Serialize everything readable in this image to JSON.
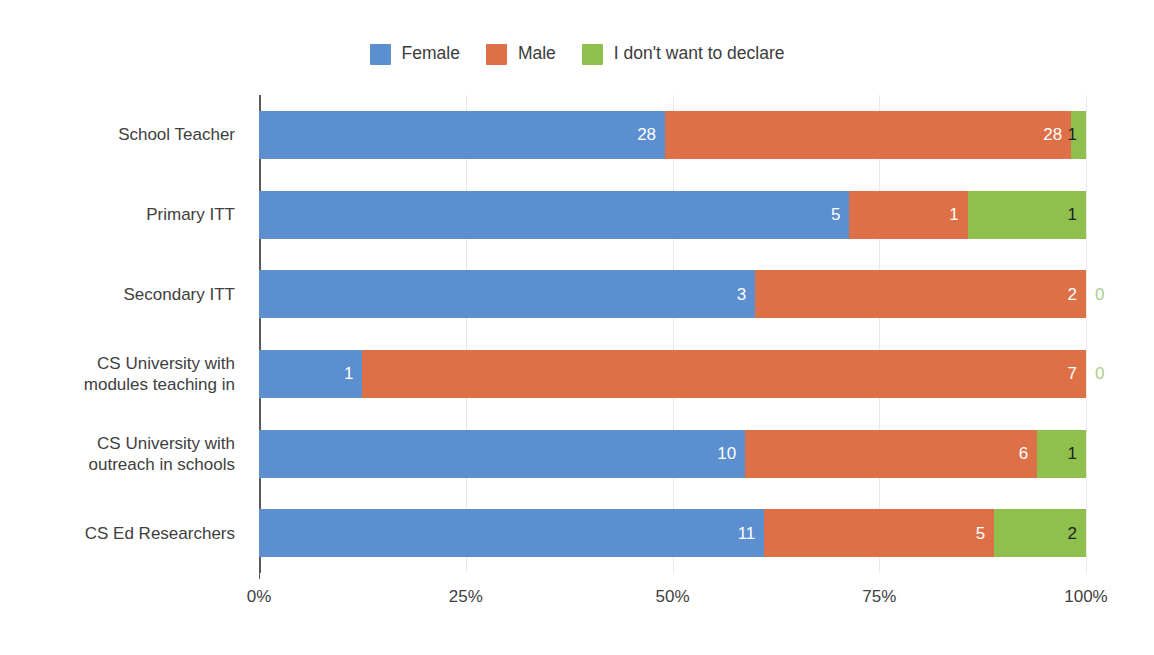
{
  "legend": {
    "position": "top-center",
    "entries": [
      {
        "label": "Female",
        "color": "#5b8fd0",
        "icon": "legend-swatch-female"
      },
      {
        "label": "Male",
        "color": "#dd7047",
        "icon": "legend-swatch-male"
      },
      {
        "label": "I don't want to declare",
        "color": "#8fbf4d",
        "icon": "legend-swatch-declare"
      }
    ]
  },
  "axis": {
    "x_ticks": [
      "0%",
      "25%",
      "50%",
      "75%",
      "100%"
    ],
    "x_tick_values": [
      0,
      25,
      50,
      75,
      100
    ]
  },
  "chart_data": {
    "type": "bar",
    "orientation": "horizontal",
    "stacked": true,
    "normalized": true,
    "title": "",
    "xlabel": "",
    "ylabel": "",
    "xlim": [
      0,
      100
    ],
    "grid": true,
    "legend_position": "top-center",
    "categories": [
      "School Teacher",
      "Primary ITT",
      "Secondary ITT",
      "CS University with modules teaching in",
      "CS University with outreach in schools",
      "CS Ed Researchers"
    ],
    "series": [
      {
        "name": "Female",
        "color": "#5b8fd0",
        "values": [
          28,
          5,
          3,
          1,
          10,
          11
        ]
      },
      {
        "name": "Male",
        "color": "#dd7047",
        "values": [
          28,
          1,
          2,
          7,
          6,
          5
        ]
      },
      {
        "name": "I don't want to declare",
        "color": "#8fbf4d",
        "values": [
          1,
          1,
          0,
          0,
          1,
          2
        ]
      }
    ],
    "row_totals": [
      57,
      7,
      5,
      8,
      17,
      18
    ],
    "percentages": [
      {
        "category": "School Teacher",
        "Female": 49.1,
        "Male": 49.1,
        "I don't want to declare": 1.8
      },
      {
        "category": "Primary ITT",
        "Female": 71.4,
        "Male": 14.3,
        "I don't want to declare": 14.3
      },
      {
        "category": "Secondary ITT",
        "Female": 60.0,
        "Male": 40.0,
        "I don't want to declare": 0.0
      },
      {
        "category": "CS University with modules teaching in",
        "Female": 12.5,
        "Male": 87.5,
        "I don't want to declare": 0.0
      },
      {
        "category": "CS University with outreach in schools",
        "Female": 58.8,
        "Male": 35.3,
        "I don't want to declare": 5.9
      },
      {
        "category": "CS Ed Researchers",
        "Female": 61.1,
        "Male": 27.8,
        "I don't want to declare": 11.1
      }
    ]
  },
  "rows": [
    {
      "label_line1": "School Teacher",
      "label_line2": "",
      "segments": [
        {
          "series": "Female",
          "value": "28",
          "pct": 49.1
        },
        {
          "series": "Male",
          "value": "28",
          "pct": 49.1
        },
        {
          "series": "I don't want to declare",
          "value": "1",
          "pct": 1.8
        }
      ]
    },
    {
      "label_line1": "Primary ITT",
      "label_line2": "",
      "segments": [
        {
          "series": "Female",
          "value": "5",
          "pct": 71.4
        },
        {
          "series": "Male",
          "value": "1",
          "pct": 14.3
        },
        {
          "series": "I don't want to declare",
          "value": "1",
          "pct": 14.3
        }
      ]
    },
    {
      "label_line1": "Secondary ITT",
      "label_line2": "",
      "segments": [
        {
          "series": "Female",
          "value": "3",
          "pct": 60.0
        },
        {
          "series": "Male",
          "value": "2",
          "pct": 40.0
        },
        {
          "series": "I don't want to declare",
          "value": "0",
          "pct": 0.0
        }
      ]
    },
    {
      "label_line1": "CS University with",
      "label_line2": "modules teaching in",
      "segments": [
        {
          "series": "Female",
          "value": "1",
          "pct": 12.5
        },
        {
          "series": "Male",
          "value": "7",
          "pct": 87.5
        },
        {
          "series": "I don't want to declare",
          "value": "0",
          "pct": 0.0
        }
      ]
    },
    {
      "label_line1": "CS University with",
      "label_line2": "outreach in schools",
      "segments": [
        {
          "series": "Female",
          "value": "10",
          "pct": 58.8
        },
        {
          "series": "Male",
          "value": "6",
          "pct": 35.3
        },
        {
          "series": "I don't want to declare",
          "value": "1",
          "pct": 5.9
        }
      ]
    },
    {
      "label_line1": "CS Ed Researchers",
      "label_line2": "",
      "segments": [
        {
          "series": "Female",
          "value": "11",
          "pct": 61.1
        },
        {
          "series": "Male",
          "value": "5",
          "pct": 27.8
        },
        {
          "series": "I don't want to declare",
          "value": "2",
          "pct": 11.1
        }
      ]
    }
  ]
}
